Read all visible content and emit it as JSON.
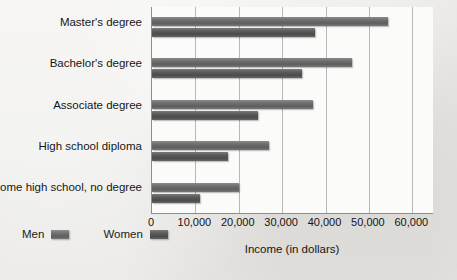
{
  "chart_data": {
    "type": "bar",
    "orientation": "horizontal",
    "title": "",
    "xlabel": "Income (in dollars)",
    "ylabel": "",
    "xlim": [
      0,
      65000
    ],
    "xticks": [
      0,
      10000,
      20000,
      30000,
      40000,
      50000,
      60000
    ],
    "xtick_labels": [
      "0",
      "10,000",
      "20,000",
      "30,000",
      "40,000",
      "50,000",
      "60,000"
    ],
    "grid": true,
    "legend_position": "bottom-left",
    "categories": [
      "Master's degree",
      "Bachelor's degree",
      "Associate degree",
      "High school diploma",
      "Some high school, no degree"
    ],
    "series": [
      {
        "name": "Men",
        "color": "#6e6e6e",
        "values": [
          54500,
          46000,
          37000,
          27000,
          20000
        ]
      },
      {
        "name": "Women",
        "color": "#545454",
        "values": [
          37500,
          34500,
          24500,
          17500,
          11000
        ]
      }
    ]
  },
  "axis": {
    "x_title": "Income (in dollars)",
    "tick_labels": [
      "0",
      "10,000",
      "20,000",
      "30,000",
      "40,000",
      "50,000",
      "60,000"
    ]
  },
  "category_labels": [
    "Master's degree",
    "Bachelor's degree",
    "Associate degree",
    "High school diploma",
    "Some high school, no degree"
  ],
  "legend": {
    "items": [
      {
        "label": "Men",
        "swatch": "men-swatch"
      },
      {
        "label": "Women",
        "swatch": "women-swatch"
      }
    ]
  }
}
